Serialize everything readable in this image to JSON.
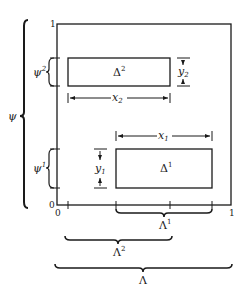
{
  "diagram": {
    "axes": {
      "y_top_label": "1",
      "y_origin_label": "0",
      "x_origin_label": "0",
      "x_right_label": "1"
    },
    "rectangles": [
      {
        "id": "delta2",
        "label": "Δ",
        "sup": "2",
        "width_label": "x",
        "width_sub": "2",
        "height_label": "y",
        "height_sub": "2"
      },
      {
        "id": "delta1",
        "label": "Δ",
        "sup": "1",
        "width_label": "x",
        "width_sub": "1",
        "height_label": "y",
        "height_sub": "1"
      }
    ],
    "vertical_braces": [
      {
        "id": "psi2",
        "label": "ψ",
        "sup": "2"
      },
      {
        "id": "psi1",
        "label": "ψ",
        "sup": "1"
      },
      {
        "id": "psi",
        "label": "ψ",
        "sup": ""
      }
    ],
    "horizontal_braces": [
      {
        "id": "lambda1",
        "label": "Λ",
        "sup": "1"
      },
      {
        "id": "lambda2",
        "label": "Λ",
        "sup": "2"
      },
      {
        "id": "lambda",
        "label": "Λ",
        "sup": ""
      }
    ]
  }
}
